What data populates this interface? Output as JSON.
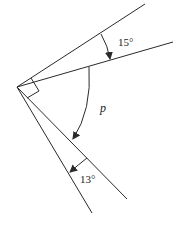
{
  "diagram": {
    "type": "angle-diagram",
    "vertex": [
      17,
      87
    ],
    "rays": [
      {
        "id": "ray-1",
        "end": [
          145,
          4
        ]
      },
      {
        "id": "ray-2",
        "end": [
          173,
          42
        ]
      },
      {
        "id": "ray-3",
        "end": [
          127,
          199
        ]
      },
      {
        "id": "ray-4",
        "end": [
          92,
          213
        ]
      }
    ],
    "right_angle_marker": true,
    "labels": {
      "angle_top": "15°",
      "angle_middle": "p",
      "angle_bottom": "13°"
    },
    "colors": {
      "stroke": "#2a2a2a",
      "background": "#ffffff"
    }
  }
}
